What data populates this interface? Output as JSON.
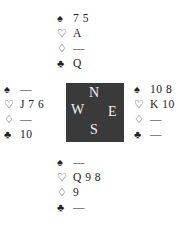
{
  "suit_symbols": {
    "spades": "♠",
    "hearts": "♡",
    "diamonds": "♢",
    "clubs": "♣"
  },
  "compass": {
    "north": "N",
    "east": "E",
    "south": "S",
    "west": "W",
    "background_color": "#3a3a3a"
  },
  "hands": {
    "north": {
      "spades": "7 5",
      "hearts": "A",
      "diamonds": "—",
      "clubs": "Q"
    },
    "west": {
      "spades": "—",
      "hearts": "J 7 6",
      "diamonds": "—",
      "clubs": "10"
    },
    "east": {
      "spades": "10 8",
      "hearts": "K 10",
      "diamonds": "—",
      "clubs": "—"
    },
    "south": {
      "spades": "—",
      "hearts": "Q 9 8",
      "diamonds": "9",
      "clubs": "—"
    }
  }
}
